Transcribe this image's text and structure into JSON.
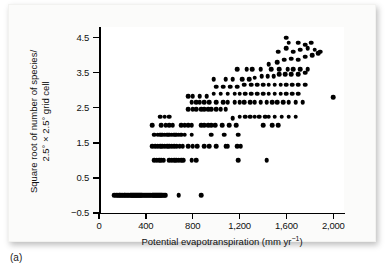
{
  "caption": "(a)",
  "axes": {
    "x": {
      "title_main": "Potential evapotranspiration (mm yr",
      "title_sup": "−1",
      "title_tail": ")",
      "ticks": [
        {
          "value": 0,
          "label": "0"
        },
        {
          "value": 400,
          "label": "400"
        },
        {
          "value": 800,
          "label": "800"
        },
        {
          "value": 1200,
          "label": "1,200"
        },
        {
          "value": 1600,
          "label": "1,600"
        },
        {
          "value": 2000,
          "label": "2,000"
        }
      ]
    },
    "y": {
      "title_line1": "Square root of number of species/",
      "title_line2": "2.5° × 2.5° grid cell",
      "ticks": [
        {
          "value": 4.5,
          "label": "4.5"
        },
        {
          "value": 3.5,
          "label": "3.5"
        },
        {
          "value": 2.5,
          "label": "2.5"
        },
        {
          "value": 1.5,
          "label": "1.5"
        },
        {
          "value": 0.5,
          "label": "0.5"
        },
        {
          "value": -0.5,
          "label": "−0.5"
        }
      ]
    }
  },
  "chart_data": {
    "type": "scatter",
    "title": "",
    "xlabel": "Potential evapotranspiration (mm yr−1)",
    "ylabel": "Square root of number of species/2.5° × 2.5° grid cell",
    "xlim": [
      0,
      2100
    ],
    "ylim": [
      -0.5,
      4.8
    ],
    "grid": false,
    "legend": null,
    "marker": {
      "shape": "circle",
      "color": "#000000",
      "size_px": 4.6
    },
    "series": [
      {
        "name": "grid cells",
        "points": [
          [
            130,
            0
          ],
          [
            145,
            0
          ],
          [
            158,
            0
          ],
          [
            170,
            0
          ],
          [
            182,
            0
          ],
          [
            193,
            0
          ],
          [
            204,
            0
          ],
          [
            214,
            0
          ],
          [
            225,
            0
          ],
          [
            235,
            0
          ],
          [
            245,
            0
          ],
          [
            255,
            0
          ],
          [
            264,
            0
          ],
          [
            273,
            0
          ],
          [
            282,
            0
          ],
          [
            291,
            0
          ],
          [
            300,
            0
          ],
          [
            309,
            0
          ],
          [
            318,
            0
          ],
          [
            327,
            0
          ],
          [
            336,
            0
          ],
          [
            345,
            0
          ],
          [
            354,
            0
          ],
          [
            362,
            0
          ],
          [
            371,
            0
          ],
          [
            380,
            0
          ],
          [
            389,
            0
          ],
          [
            398,
            0
          ],
          [
            407,
            0
          ],
          [
            416,
            0
          ],
          [
            425,
            0
          ],
          [
            434,
            0
          ],
          [
            443,
            0
          ],
          [
            452,
            0
          ],
          [
            461,
            0
          ],
          [
            470,
            0
          ],
          [
            479,
            0
          ],
          [
            488,
            0
          ],
          [
            497,
            0
          ],
          [
            506,
            0
          ],
          [
            515,
            0
          ],
          [
            524,
            0
          ],
          [
            533,
            0
          ],
          [
            542,
            0
          ],
          [
            551,
            0
          ],
          [
            560,
            0
          ],
          [
            570,
            0
          ],
          [
            680,
            0
          ],
          [
            870,
            0
          ],
          [
            470,
            1.0
          ],
          [
            492,
            1.0
          ],
          [
            512,
            1.0
          ],
          [
            533,
            1.0
          ],
          [
            553,
            1.0
          ],
          [
            600,
            1.0
          ],
          [
            620,
            1.0
          ],
          [
            640,
            1.0
          ],
          [
            660,
            1.0
          ],
          [
            680,
            1.0
          ],
          [
            700,
            1.0
          ],
          [
            720,
            1.0
          ],
          [
            790,
            1.0
          ],
          [
            830,
            1.0
          ],
          [
            1190,
            1.0
          ],
          [
            1430,
            1.0
          ],
          [
            455,
            1.4
          ],
          [
            480,
            1.4
          ],
          [
            500,
            1.4
          ],
          [
            520,
            1.4
          ],
          [
            540,
            1.4
          ],
          [
            560,
            1.4
          ],
          [
            580,
            1.4
          ],
          [
            600,
            1.4
          ],
          [
            620,
            1.4
          ],
          [
            640,
            1.4
          ],
          [
            665,
            1.4
          ],
          [
            690,
            1.4
          ],
          [
            715,
            1.4
          ],
          [
            760,
            1.4
          ],
          [
            800,
            1.4
          ],
          [
            840,
            1.4
          ],
          [
            900,
            1.4
          ],
          [
            940,
            1.4
          ],
          [
            1000,
            1.4
          ],
          [
            1080,
            1.4
          ],
          [
            1100,
            1.4
          ],
          [
            1180,
            1.4
          ],
          [
            1210,
            1.4
          ],
          [
            470,
            1.73
          ],
          [
            500,
            1.73
          ],
          [
            520,
            1.73
          ],
          [
            540,
            1.73
          ],
          [
            560,
            1.73
          ],
          [
            580,
            1.73
          ],
          [
            600,
            1.73
          ],
          [
            620,
            1.73
          ],
          [
            640,
            1.73
          ],
          [
            660,
            1.73
          ],
          [
            680,
            1.73
          ],
          [
            700,
            1.73
          ],
          [
            730,
            1.73
          ],
          [
            790,
            1.73
          ],
          [
            960,
            1.73
          ],
          [
            1070,
            1.73
          ],
          [
            1190,
            1.73
          ],
          [
            455,
            2.0
          ],
          [
            530,
            2.0
          ],
          [
            570,
            2.0
          ],
          [
            600,
            2.0
          ],
          [
            630,
            2.0
          ],
          [
            700,
            2.0
          ],
          [
            730,
            2.0
          ],
          [
            760,
            2.0
          ],
          [
            790,
            2.0
          ],
          [
            870,
            2.0
          ],
          [
            900,
            2.0
          ],
          [
            930,
            2.0
          ],
          [
            960,
            2.0
          ],
          [
            990,
            2.0
          ],
          [
            1050,
            2.0
          ],
          [
            1110,
            2.0
          ],
          [
            1170,
            2.0
          ],
          [
            1400,
            2.0
          ],
          [
            1480,
            2.0
          ],
          [
            1530,
            2.0
          ],
          [
            520,
            2.24
          ],
          [
            560,
            2.24
          ],
          [
            600,
            2.24
          ],
          [
            760,
            2.45
          ],
          [
            800,
            2.45
          ],
          [
            830,
            2.45
          ],
          [
            870,
            2.45
          ],
          [
            900,
            2.45
          ],
          [
            930,
            2.45
          ],
          [
            960,
            2.45
          ],
          [
            1000,
            2.45
          ],
          [
            1040,
            2.45
          ],
          [
            1080,
            2.45
          ],
          [
            1140,
            2.2
          ],
          [
            1200,
            2.24
          ],
          [
            1250,
            2.24
          ],
          [
            1290,
            2.24
          ],
          [
            1330,
            2.24
          ],
          [
            1370,
            2.24
          ],
          [
            1420,
            2.24
          ],
          [
            1450,
            2.24
          ],
          [
            1500,
            2.24
          ],
          [
            1560,
            2.24
          ],
          [
            1620,
            2.24
          ],
          [
            1680,
            2.24
          ],
          [
            790,
            2.65
          ],
          [
            830,
            2.65
          ],
          [
            860,
            2.65
          ],
          [
            900,
            2.65
          ],
          [
            940,
            2.65
          ],
          [
            1000,
            2.65
          ],
          [
            1060,
            2.65
          ],
          [
            1100,
            2.65
          ],
          [
            1160,
            2.65
          ],
          [
            1200,
            2.65
          ],
          [
            1240,
            2.65
          ],
          [
            1290,
            2.65
          ],
          [
            1330,
            2.65
          ],
          [
            1380,
            2.65
          ],
          [
            1430,
            2.65
          ],
          [
            1480,
            2.65
          ],
          [
            1520,
            2.65
          ],
          [
            1570,
            2.65
          ],
          [
            1620,
            2.65
          ],
          [
            1680,
            2.65
          ],
          [
            1740,
            2.65
          ],
          [
            2000,
            2.8
          ],
          [
            760,
            2.83
          ],
          [
            800,
            2.83
          ],
          [
            860,
            2.83
          ],
          [
            920,
            2.83
          ],
          [
            980,
            2.9
          ],
          [
            1040,
            2.9
          ],
          [
            1100,
            2.9
          ],
          [
            1160,
            2.9
          ],
          [
            1200,
            2.9
          ],
          [
            1250,
            2.9
          ],
          [
            1300,
            2.9
          ],
          [
            1350,
            2.9
          ],
          [
            1400,
            2.9
          ],
          [
            1450,
            2.9
          ],
          [
            1500,
            2.9
          ],
          [
            1550,
            2.9
          ],
          [
            1600,
            2.9
          ],
          [
            1650,
            2.9
          ],
          [
            1700,
            2.9
          ],
          [
            1000,
            3.1
          ],
          [
            1060,
            3.1
          ],
          [
            1120,
            3.1
          ],
          [
            1180,
            3.1
          ],
          [
            1240,
            3.16
          ],
          [
            1300,
            3.16
          ],
          [
            1350,
            3.16
          ],
          [
            1400,
            3.16
          ],
          [
            1450,
            3.16
          ],
          [
            1500,
            3.16
          ],
          [
            1550,
            3.16
          ],
          [
            1600,
            3.16
          ],
          [
            1650,
            3.16
          ],
          [
            1700,
            3.16
          ],
          [
            1760,
            3.16
          ],
          [
            980,
            3.32
          ],
          [
            1080,
            3.32
          ],
          [
            1140,
            3.32
          ],
          [
            1220,
            3.32
          ],
          [
            1280,
            3.32
          ],
          [
            1330,
            3.35
          ],
          [
            1390,
            3.4
          ],
          [
            1440,
            3.4
          ],
          [
            1490,
            3.4
          ],
          [
            1540,
            3.45
          ],
          [
            1590,
            3.45
          ],
          [
            1640,
            3.45
          ],
          [
            1700,
            3.45
          ],
          [
            1760,
            3.5
          ],
          [
            1180,
            3.6
          ],
          [
            1260,
            3.6
          ],
          [
            1310,
            3.6
          ],
          [
            1380,
            3.6
          ],
          [
            1470,
            3.6
          ],
          [
            1540,
            3.6
          ],
          [
            1610,
            3.6
          ],
          [
            1660,
            3.6
          ],
          [
            1720,
            3.6
          ],
          [
            1780,
            3.6
          ],
          [
            1450,
            3.74
          ],
          [
            1520,
            3.8
          ],
          [
            1580,
            3.87
          ],
          [
            1640,
            3.9
          ],
          [
            1700,
            3.87
          ],
          [
            1760,
            3.95
          ],
          [
            1820,
            4.0
          ],
          [
            1870,
            4.05
          ],
          [
            1530,
            4.1
          ],
          [
            1600,
            4.2
          ],
          [
            1660,
            4.1
          ],
          [
            1720,
            4.15
          ],
          [
            1780,
            4.2
          ],
          [
            1840,
            4.15
          ],
          [
            1890,
            4.1
          ],
          [
            1600,
            4.5
          ],
          [
            1620,
            4.35
          ],
          [
            1700,
            4.35
          ],
          [
            1760,
            4.3
          ],
          [
            1810,
            4.35
          ]
        ]
      }
    ]
  }
}
